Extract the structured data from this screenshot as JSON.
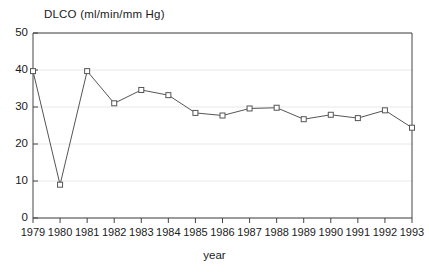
{
  "chart_data": {
    "type": "line",
    "title": "DLCO (ml/min/mm Hg)",
    "xlabel": "year",
    "ylabel": "",
    "categories": [
      "1979",
      "1980",
      "1981",
      "1982",
      "1983",
      "1984",
      "1985",
      "1986",
      "1987",
      "1988",
      "1989",
      "1990",
      "1991",
      "1992",
      "1993"
    ],
    "values": [
      39.7,
      9.0,
      39.7,
      31.0,
      34.6,
      33.2,
      28.4,
      27.7,
      29.6,
      29.8,
      26.7,
      27.9,
      27.0,
      29.1,
      24.4
    ],
    "x": [
      1979,
      1980,
      1981,
      1982,
      1983,
      1984,
      1985,
      1986,
      1987,
      1988,
      1989,
      1990,
      1991,
      1992,
      1993
    ],
    "ylim": [
      0,
      50
    ],
    "xlim": [
      1979,
      1993
    ],
    "yticks": [
      "0",
      "10",
      "20",
      "30",
      "40",
      "50"
    ],
    "ytick_values": [
      0,
      10,
      20,
      30,
      40,
      50
    ],
    "grid": true,
    "legend": null,
    "marker": "open-square",
    "line_color": "#555555",
    "marker_color": "#555555",
    "grid_color": "#e8e8e8",
    "axis_color": "#444444",
    "text_color": "#1a1a1a"
  }
}
